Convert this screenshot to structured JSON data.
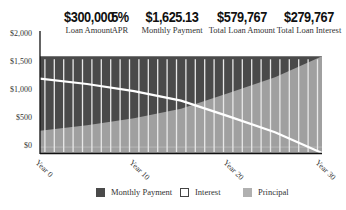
{
  "summary": [
    {
      "value": "$300,000",
      "label": "Loan Amount"
    },
    {
      "value": "5%",
      "label": "APR"
    },
    {
      "value": "$1,625.13",
      "label": "Monthly Payment"
    },
    {
      "value": "$579,767",
      "label": "Total Loan Amount"
    },
    {
      "value": "$279,767",
      "label": "Total Loan Interest"
    }
  ],
  "colors": {
    "monthly_payment": "#4a4a4a",
    "principal": "#a0a0a0",
    "interest_line": "#ffffff",
    "year_bars": "#e8e8e8",
    "axis": "#111111"
  },
  "legend": [
    {
      "label": "Monthly Payment",
      "swatch": "dark"
    },
    {
      "label": "Interest",
      "swatch": "outline"
    },
    {
      "label": "Principal",
      "swatch": "light"
    }
  ],
  "chart_data": {
    "type": "area",
    "title": "",
    "xlabel": "",
    "ylabel": "",
    "ylim": [
      0,
      2000
    ],
    "y_ticks": [
      "$2,000",
      "$1,500",
      "$1,000",
      "$500",
      "$0"
    ],
    "x_ticks": [
      "Year 0",
      "Year 10",
      "Year 20",
      "Year 30"
    ],
    "x": [
      0,
      5,
      10,
      15,
      20,
      25,
      30
    ],
    "series": [
      {
        "name": "Monthly Payment",
        "style": "area-dark",
        "values": [
          1625,
          1625,
          1625,
          1625,
          1625,
          1625,
          1625
        ]
      },
      {
        "name": "Interest",
        "style": "line-white",
        "values": [
          1250,
          1160,
          1040,
          880,
          620,
          350,
          0
        ]
      },
      {
        "name": "Principal",
        "style": "area-light",
        "values": [
          375,
          465,
          585,
          745,
          1005,
          1275,
          1625
        ]
      }
    ],
    "grid": false,
    "legend_position": "bottom"
  }
}
